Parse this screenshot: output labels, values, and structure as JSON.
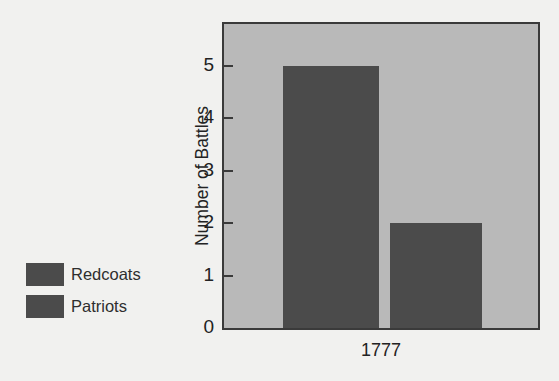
{
  "chart_data": {
    "type": "bar",
    "title": "",
    "subtitle": "",
    "xlabel": "",
    "ylabel": "Number of Battles",
    "categories": [
      "1777"
    ],
    "series": [
      {
        "name": "Redcoats",
        "values": [
          5
        ],
        "color": "#4b4b4b"
      },
      {
        "name": "Patriots",
        "values": [
          2
        ],
        "color": "#4b4b4b"
      }
    ],
    "ylim": [
      0,
      5.8
    ],
    "yticks": [
      0,
      1,
      2,
      3,
      4,
      5
    ],
    "ytick_labels": [
      "0",
      "1",
      "2",
      "3",
      "4",
      "5"
    ],
    "grid": false,
    "legend_position": "left-outside",
    "annotations": []
  },
  "legend": {
    "items": [
      {
        "label": "Redcoats",
        "color": "#4b4b4b"
      },
      {
        "label": "Patriots",
        "color": "#4b4b4b"
      }
    ]
  },
  "axes": {
    "y_title": "Number of Battles",
    "y_tick_labels": [
      "5",
      "4",
      "3",
      "2",
      "1",
      "0"
    ],
    "x_tick_labels": [
      "1777"
    ]
  },
  "colors": {
    "page_background": "#f1f1ef",
    "plot_background": "#b9b9b9",
    "plot_border": "#3a3a3a",
    "bar_fill": "#4b4b4b",
    "text": "#232323"
  }
}
